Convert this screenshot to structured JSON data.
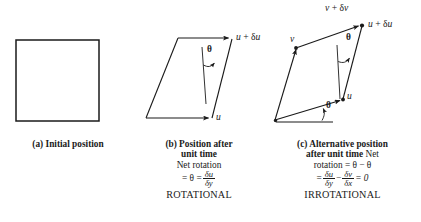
{
  "figure": {
    "background": "#ffffff",
    "ink": "#1a1a1a"
  },
  "panels": [
    {
      "id": "a",
      "caption_lines": [
        {
          "text": "(a) Initial position",
          "style": "bold"
        }
      ],
      "shape": {
        "type": "square",
        "points": "16,40 99,40 99,121 16,121"
      },
      "labels": []
    },
    {
      "id": "b",
      "caption_lines": [
        {
          "text": "(b) Position after",
          "style": "bold"
        },
        {
          "text": "unit time",
          "style": "bold"
        },
        {
          "text": "Net rotation",
          "style": "regular"
        },
        {
          "text": "= θ = δu/δy",
          "style": "formula"
        },
        {
          "text": "ROTATIONAL",
          "style": "caps"
        }
      ],
      "shape": {
        "type": "parallelogram",
        "points": "146,118 178,38 232,38 212,118"
      },
      "labels": [
        {
          "name": "label-u-plus-du",
          "text": "u + δu",
          "x": 236,
          "y": 32
        },
        {
          "name": "label-u",
          "text": "u",
          "x": 216,
          "y": 113
        },
        {
          "name": "label-theta",
          "text": "θ",
          "x": 209,
          "y": 50
        }
      ],
      "formula": {
        "lhs": "= θ =",
        "num": "δu",
        "den": "δy"
      }
    },
    {
      "id": "c",
      "caption_lines": [
        {
          "text": "(c) Alternative position",
          "style": "bold"
        },
        {
          "text": "after unit time Net",
          "style": "bold-mixed"
        },
        {
          "text": "rotation = θ − θ",
          "style": "regular"
        },
        {
          "text": "= δu/δy − δv/δx = 0",
          "style": "formula"
        },
        {
          "text": "IRROTATIONAL",
          "style": "caps"
        }
      ],
      "shape": {
        "type": "parallelogram",
        "points": "275,120 296,48 362,25 343,99"
      },
      "reference_line": {
        "x1": 276,
        "y1": 122,
        "x2": 333,
        "y2": 122
      },
      "labels": [
        {
          "name": "label-v-plus-dv",
          "text": "v + δv",
          "x": 326,
          "y": 4
        },
        {
          "name": "label-u-plus-du",
          "text": "u + δu",
          "x": 367,
          "y": 19
        },
        {
          "name": "label-v",
          "text": "v",
          "x": 291,
          "y": 34
        },
        {
          "name": "label-u",
          "text": "u",
          "x": 347,
          "y": 93
        },
        {
          "name": "label-theta-top",
          "text": "θ",
          "x": 348,
          "y": 37
        },
        {
          "name": "label-theta-bottom",
          "text": "θ",
          "x": 327,
          "y": 103
        }
      ],
      "formula": {
        "lhs": "=",
        "num1": "δu",
        "den1": "δy",
        "op": "−",
        "num2": "δv",
        "den2": "δx",
        "rhs": "= 0"
      }
    }
  ],
  "caption_text": {
    "a_line1": "(a) Initial position",
    "b_line1": "(b) Position after",
    "b_line2": "unit time",
    "b_line3": "Net rotation",
    "b_eq_lhs": "= θ =",
    "b_eq_num": "δu",
    "b_eq_den": "δy",
    "b_line5": "ROTATIONAL",
    "c_line1": "(c) Alternative position",
    "c_line2a": "after unit time",
    "c_line2b": "Net",
    "c_line3": "rotation = θ − θ",
    "c_eq_lhs": "=",
    "c_eq_num1": "δu",
    "c_eq_den1": "δy",
    "c_eq_op": "−",
    "c_eq_num2": "δv",
    "c_eq_den2": "δx",
    "c_eq_rhs": "= 0",
    "c_line5": "IRROTATIONAL"
  },
  "math_labels": {
    "b_u_plus_du": "u + δu",
    "b_u": "u",
    "b_theta": "θ",
    "c_v_plus_dv": "v + δv",
    "c_u_plus_du": "u + δu",
    "c_v": "v",
    "c_u": "u",
    "c_theta_top": "θ",
    "c_theta_bottom": "θ"
  }
}
